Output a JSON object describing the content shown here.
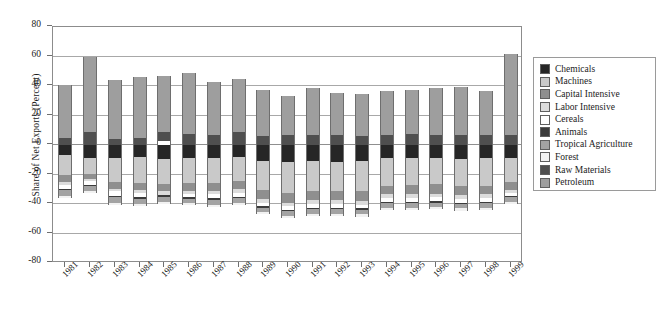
{
  "chart_data": {
    "type": "bar",
    "title": "",
    "subtitle": "",
    "xlabel": "",
    "ylabel": "Share of Net Exports (Percent)",
    "ylim": [
      -80,
      80
    ],
    "ytick_labels": [
      "80",
      "60",
      "40",
      "20",
      "0",
      "-20",
      "-40",
      "-60",
      "-80"
    ],
    "ytick_values": [
      80,
      60,
      40,
      20,
      0,
      -20,
      -40,
      -60,
      -80
    ],
    "grid": true,
    "stacked": true,
    "legend_position": "right",
    "categories": [
      "1981",
      "1982",
      "1983",
      "1984",
      "1985",
      "1986",
      "1987",
      "1988",
      "1989",
      "1990",
      "1991",
      "1992",
      "1993",
      "1994",
      "1995",
      "1996",
      "1997",
      "1998",
      "1999"
    ],
    "series": [
      {
        "name": "Chemicals",
        "color": "#262626",
        "values": [
          -6.5,
          -9.0,
          -8.5,
          -8.0,
          -9.5,
          -9.0,
          -9.0,
          -8.0,
          -11.0,
          -11.5,
          -11.0,
          -11.5,
          -11.0,
          -9.0,
          -9.0,
          -9.0,
          -9.5,
          -9.0,
          -9.0
        ]
      },
      {
        "name": "Machines",
        "color": "#c9c9c9",
        "values": [
          -14.0,
          -10.5,
          -16.5,
          -17.5,
          -17.0,
          -17.0,
          -16.5,
          -16.5,
          -19.5,
          -21.0,
          -20.5,
          -20.0,
          -20.5,
          -18.5,
          -18.0,
          -17.5,
          -18.0,
          -18.5,
          -16.0
        ]
      },
      {
        "name": "Capital Intensive",
        "color": "#8f8f8f",
        "values": [
          -4.5,
          -3.5,
          -4.5,
          -5.0,
          -5.0,
          -5.0,
          -5.5,
          -5.5,
          -6.0,
          -6.5,
          -6.0,
          -6.0,
          -6.5,
          -6.0,
          -6.5,
          -6.5,
          -6.5,
          -6.0,
          -5.5
        ]
      },
      {
        "name": "Labor Intensive",
        "color": "#dcdcdc",
        "values": [
          -2.0,
          -1.5,
          -2.0,
          -2.0,
          -2.5,
          -2.5,
          -2.5,
          -2.5,
          -2.5,
          -2.5,
          -2.5,
          -2.5,
          -2.5,
          -2.5,
          -2.5,
          -2.5,
          -2.5,
          -2.5,
          -2.0
        ]
      },
      {
        "name": "Cereals",
        "color": "#ffffff",
        "values": [
          -2.5,
          -2.5,
          -3.0,
          -3.0,
          2.5,
          -2.0,
          -2.5,
          -2.5,
          -2.5,
          -2.5,
          -2.5,
          -2.5,
          -2.5,
          -2.5,
          -2.5,
          -2.5,
          -2.5,
          -2.5,
          -2.0
        ]
      },
      {
        "name": "Animals",
        "color": "#3b3b3b",
        "values": [
          -1.0,
          -1.0,
          -1.0,
          -1.0,
          -1.0,
          -1.0,
          -1.0,
          -1.0,
          -1.0,
          -1.0,
          -1.0,
          -1.0,
          -1.0,
          -1.0,
          -1.0,
          -1.0,
          -1.0,
          -1.0,
          -1.0
        ]
      },
      {
        "name": "Tropical Agriculture",
        "color": "#a3a3a3",
        "values": [
          -4.0,
          -3.0,
          -3.5,
          -3.5,
          -3.5,
          -3.0,
          -3.5,
          -3.5,
          -3.0,
          -3.0,
          -3.0,
          -3.0,
          -3.0,
          -3.0,
          -3.0,
          -3.0,
          -3.0,
          -3.0,
          -3.0
        ]
      },
      {
        "name": "Forest",
        "color": "#f2f2f2",
        "values": [
          -1.5,
          -1.5,
          -1.5,
          -1.5,
          -1.5,
          -1.5,
          -1.5,
          -1.5,
          -1.5,
          -1.5,
          -1.5,
          -1.5,
          -1.5,
          -1.5,
          -1.5,
          -1.5,
          -1.5,
          -1.5,
          -1.5
        ]
      },
      {
        "name": "Raw Materials",
        "color": "#4f4f4f",
        "values": [
          5.0,
          8.5,
          4.0,
          4.5,
          6.0,
          7.5,
          7.0,
          9.0,
          6.0,
          6.5,
          7.0,
          6.5,
          6.0,
          7.0,
          7.5,
          7.0,
          7.0,
          7.0,
          6.5
        ]
      },
      {
        "name": "Petroleum",
        "color": "#9e9e9e",
        "values": [
          36.0,
          51.5,
          40.0,
          41.5,
          38.5,
          41.0,
          36.0,
          35.5,
          31.5,
          27.0,
          31.5,
          28.5,
          28.5,
          29.5,
          30.0,
          31.5,
          32.0,
          29.5,
          55.0
        ]
      }
    ],
    "bar_totals_positive": [
      41,
      60,
      44,
      46,
      44.5,
      48.5,
      43,
      44.5,
      37.5,
      33.5,
      38.5,
      35,
      34.5,
      36.5,
      37.5,
      38.5,
      39,
      36.5,
      61.5
    ],
    "bar_totals_negative": [
      -36,
      -32.5,
      -40.5,
      -41.5,
      -39,
      -40,
      -42,
      -41,
      -46,
      -49.5,
      -48,
      -48,
      -48.5,
      -44,
      -44,
      -43.5,
      -44.5,
      -44,
      -40
    ]
  },
  "legend": {
    "items": [
      {
        "label": "Chemicals"
      },
      {
        "label": "Machines"
      },
      {
        "label": "Capital Intensive"
      },
      {
        "label": "Labor Intensive"
      },
      {
        "label": "Cereals"
      },
      {
        "label": "Animals"
      },
      {
        "label": "Tropical Agriculture"
      },
      {
        "label": "Forest"
      },
      {
        "label": "Raw Materials"
      },
      {
        "label": "Petroleum"
      }
    ]
  }
}
